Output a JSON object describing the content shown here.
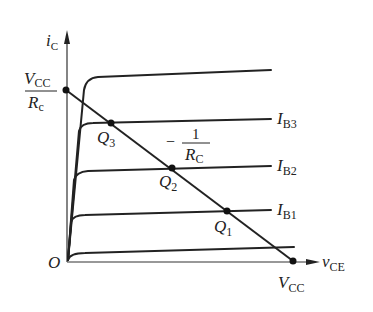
{
  "diagram": {
    "y_axis": {
      "symbol": "i",
      "sub": "C"
    },
    "x_axis": {
      "symbol": "v",
      "sub": "CE"
    },
    "origin": "O",
    "y_intercept": {
      "num_sym": "V",
      "num_sub": "CC",
      "den_sym": "R",
      "den_sub": "c"
    },
    "x_intercept": {
      "symbol": "V",
      "sub": "CC"
    },
    "slope_label": {
      "sign": "−",
      "num": "1",
      "den_sym": "R",
      "den_sub": "C"
    },
    "curves": [
      {
        "symbol": "I",
        "sub": "B3"
      },
      {
        "symbol": "I",
        "sub": "B2"
      },
      {
        "symbol": "I",
        "sub": "B1"
      }
    ],
    "q_points": [
      {
        "symbol": "Q",
        "sub": "3"
      },
      {
        "symbol": "Q",
        "sub": "2"
      },
      {
        "symbol": "Q",
        "sub": "1"
      }
    ],
    "colors": {
      "line": "#222222",
      "axis": "#333333"
    }
  }
}
